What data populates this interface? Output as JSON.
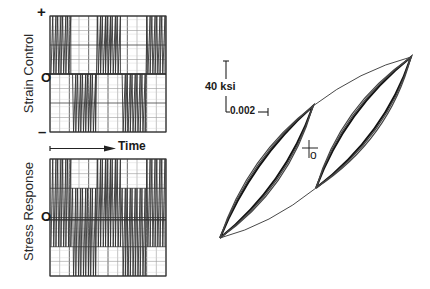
{
  "figure": {
    "strain_panel": {
      "ylabel": "Strain Control",
      "plus_label": "+",
      "zero_label": "O",
      "minus_label": "–",
      "waveform": "block-random strain history alternating between positive-mean and negative-mean blocks"
    },
    "time_axis": {
      "label": "Time"
    },
    "stress_panel": {
      "ylabel": "Stress Response",
      "zero_label": "O"
    },
    "hysteresis": {
      "stress_scale_label": "40 ksi",
      "strain_scale_label": "0.002",
      "origin_label": "o"
    }
  },
  "chart_data": [
    {
      "type": "line",
      "title": "Strain Control",
      "xlabel": "Time",
      "ylabel": "Strain Control",
      "y_tick_labels": [
        "+",
        "O",
        "–"
      ],
      "ylim": [
        -1,
        1
      ],
      "grid": true,
      "series": [
        {
          "name": "strain",
          "blocks": [
            {
              "range": [
                0,
                1
              ],
              "cycles": 4
            },
            {
              "range": [
                -1,
                0
              ],
              "cycles": 5
            },
            {
              "range": [
                0,
                1
              ],
              "cycles": 5
            },
            {
              "range": [
                -1,
                0
              ],
              "cycles": 5
            },
            {
              "range": [
                0,
                1
              ],
              "cycles": 4
            }
          ]
        }
      ]
    },
    {
      "type": "line",
      "title": "Stress Response",
      "xlabel": "Time",
      "ylabel": "Stress Response",
      "y_tick_labels": [
        "O"
      ],
      "ylim": [
        -1,
        1
      ],
      "grid": true,
      "series": [
        {
          "name": "stress",
          "blocks": [
            {
              "range": [
                -0.5,
                1
              ],
              "cycles": 4
            },
            {
              "range": [
                -1,
                0.5
              ],
              "cycles": 5
            },
            {
              "range": [
                -0.5,
                1
              ],
              "cycles": 5
            },
            {
              "range": [
                -1,
                0.5
              ],
              "cycles": 5
            },
            {
              "range": [
                -0.5,
                1
              ],
              "cycles": 4
            }
          ]
        }
      ]
    },
    {
      "type": "line",
      "title": "Stress-strain hysteresis loops",
      "xlabel": "Strain (scale bar 0.002)",
      "ylabel": "Stress (scale bar 40 ksi)",
      "annotations": [
        "40 ksi",
        "0.002",
        "o"
      ],
      "series": [
        {
          "name": "outer-envelope",
          "points_strain_ksi_units": [
            [
              -0.005,
              -100
            ],
            [
              0.0,
              -45
            ],
            [
              0.005,
              100
            ],
            [
              0.0,
              45
            ]
          ]
        },
        {
          "name": "lower-left-loops",
          "points_strain_ksi_units": [
            [
              -0.005,
              -100
            ],
            [
              0.0,
              45
            ]
          ]
        },
        {
          "name": "upper-right-loops",
          "points_strain_ksi_units": [
            [
              0.0,
              -45
            ],
            [
              0.005,
              100
            ]
          ]
        }
      ]
    }
  ]
}
